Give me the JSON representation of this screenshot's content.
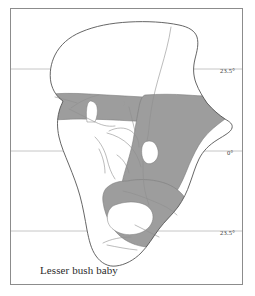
{
  "figure": {
    "caption": "Lesser bush baby",
    "subject": "Lesser bush baby",
    "region": "Africa",
    "map_type": "species distribution range map"
  },
  "colors": {
    "range_fill": "#9d9d9d",
    "range_stroke": "#7d7d7d",
    "coastline": "#555555",
    "river": "#8e8e8e",
    "latitude_line": "#b8b8b8",
    "frame": "#8c8c8c",
    "background": "#ffffff",
    "text": "#2b2b2b"
  },
  "latitude_lines": [
    {
      "id": "tropic-of-cancer",
      "label": "23.5°",
      "y": 60
    },
    {
      "id": "equator",
      "label": "0°",
      "y": 142
    },
    {
      "id": "tropic-of-capricorn",
      "label": "23.5°",
      "y": 222
    }
  ],
  "legend": {
    "shaded_meaning": "distribution range"
  },
  "features": [
    {
      "name": "africa-coastline",
      "type": "outline"
    },
    {
      "name": "distribution-range-sahel-band",
      "type": "shaded-range"
    },
    {
      "name": "distribution-range-east-africa",
      "type": "shaded-range"
    },
    {
      "name": "distribution-range-southern-africa",
      "type": "shaded-range"
    },
    {
      "name": "lake-victoria",
      "type": "lake"
    },
    {
      "name": "river-network",
      "type": "rivers"
    }
  ]
}
